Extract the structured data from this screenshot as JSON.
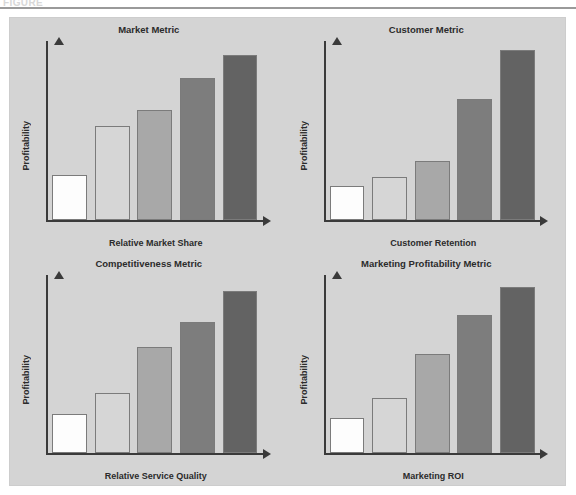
{
  "figure": {
    "caption_fragment": "FIGURE",
    "panel_background": "#d4d4d4",
    "page_background": "#ffffff",
    "rule_color": "#9a9a9a"
  },
  "bar_palette": [
    "#fdfdfd",
    "#d6d6d6",
    "#a8a8a8",
    "#7d7d7d",
    "#636363"
  ],
  "bar_outline": "#7b7b7b",
  "axis_color": "#3a3a3a",
  "chart_data": [
    {
      "type": "bar",
      "title": "Market Metric",
      "xlabel": "Relative Market Share",
      "ylabel": "Profitability",
      "categories": [
        "1",
        "2",
        "3",
        "4",
        "5"
      ],
      "values": [
        25,
        53,
        62,
        80,
        93
      ],
      "ylim": [
        0,
        100
      ],
      "grid": false,
      "legend": "none"
    },
    {
      "type": "bar",
      "title": "Customer Metric",
      "xlabel": "Customer Retention",
      "ylabel": "Profitability",
      "categories": [
        "1",
        "2",
        "3",
        "4",
        "5"
      ],
      "values": [
        19,
        24,
        33,
        68,
        96
      ],
      "ylim": [
        0,
        100
      ],
      "grid": false,
      "legend": "none"
    },
    {
      "type": "bar",
      "title": "Competitiveness Metric",
      "xlabel": "Relative Service Quality",
      "ylabel": "Profitability",
      "categories": [
        "1",
        "2",
        "3",
        "4",
        "5"
      ],
      "values": [
        22,
        34,
        60,
        74,
        92
      ],
      "ylim": [
        0,
        100
      ],
      "grid": false,
      "legend": "none"
    },
    {
      "type": "bar",
      "title": "Marketing Profitability Metric",
      "xlabel": "Marketing ROI",
      "ylabel": "Profitability",
      "categories": [
        "1",
        "2",
        "3",
        "4",
        "5"
      ],
      "values": [
        20,
        31,
        56,
        78,
        94
      ],
      "ylim": [
        0,
        100
      ],
      "grid": false,
      "legend": "none"
    }
  ]
}
